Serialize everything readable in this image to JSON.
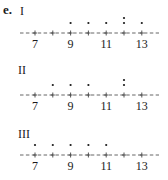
{
  "part_label": "e.",
  "chart_data": [
    {
      "type": "dotplot",
      "title": "I",
      "axis": {
        "min": 7,
        "max": 13,
        "ticks": [
          7,
          8,
          9,
          10,
          11,
          12,
          13
        ],
        "tick_labels": [
          "7",
          "9",
          "11",
          "13"
        ]
      },
      "values": [
        9,
        10,
        11,
        12,
        12,
        13
      ],
      "counts": {
        "9": 1,
        "10": 1,
        "11": 1,
        "12": 2,
        "13": 1
      }
    },
    {
      "type": "dotplot",
      "title": "II",
      "axis": {
        "min": 7,
        "max": 13,
        "ticks": [
          7,
          8,
          9,
          10,
          11,
          12,
          13
        ],
        "tick_labels": [
          "7",
          "9",
          "11",
          "13"
        ]
      },
      "values": [
        8,
        9,
        10,
        12,
        12
      ],
      "counts": {
        "8": 1,
        "9": 1,
        "10": 1,
        "12": 2
      }
    },
    {
      "type": "dotplot",
      "title": "III",
      "axis": {
        "min": 7,
        "max": 13,
        "ticks": [
          7,
          8,
          9,
          10,
          11,
          12,
          13
        ],
        "tick_labels": [
          "7",
          "9",
          "11",
          "13"
        ]
      },
      "values": [
        7,
        8,
        9,
        10,
        11
      ],
      "counts": {
        "7": 1,
        "8": 1,
        "9": 1,
        "10": 1,
        "11": 1
      }
    }
  ]
}
